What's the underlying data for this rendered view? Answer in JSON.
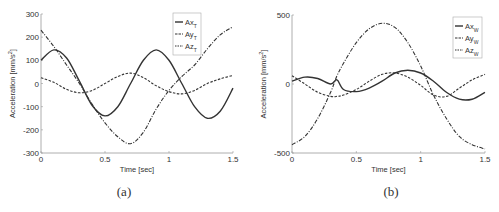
{
  "chart_data": [
    {
      "type": "line",
      "caption": "(a)",
      "xlabel": "Time [sec]",
      "ylabel": "Acceleration [mm/s²]",
      "xlim": [
        0,
        1.5
      ],
      "ylim": [
        -300,
        300
      ],
      "xticks": [
        "0",
        "0.5",
        "1",
        "1.5"
      ],
      "yticks": [
        "300",
        "200",
        "100",
        "0",
        "-100",
        "-200",
        "-300"
      ],
      "legend": [
        "AxT",
        "AyT",
        "AzT"
      ],
      "x": [
        0,
        0.1,
        0.2,
        0.3,
        0.4,
        0.5,
        0.6,
        0.7,
        0.8,
        0.9,
        1.0,
        1.1,
        1.2,
        1.3,
        1.4,
        1.5
      ],
      "series": [
        {
          "name": "AxT",
          "style": "solid",
          "values": [
            100,
            145,
            110,
            10,
            -95,
            -140,
            -100,
            0,
            100,
            145,
            100,
            0,
            -100,
            -150,
            -120,
            -20
          ]
        },
        {
          "name": "AyT",
          "style": "dash-dot",
          "values": [
            230,
            160,
            80,
            0,
            -90,
            -170,
            -230,
            -260,
            -210,
            -110,
            -30,
            30,
            80,
            150,
            210,
            245
          ]
        },
        {
          "name": "AzT",
          "style": "dashed",
          "values": [
            25,
            5,
            -25,
            -40,
            -30,
            0,
            30,
            45,
            25,
            -10,
            -35,
            -45,
            -30,
            0,
            20,
            35
          ]
        }
      ]
    },
    {
      "type": "line",
      "caption": "(b)",
      "xlabel": "Time [sec]",
      "ylabel": "Acceleration [mm/s²]",
      "xlim": [
        0,
        1.5
      ],
      "ylim": [
        -500,
        500
      ],
      "xticks": [
        "0",
        "0.5",
        "1",
        "1.5"
      ],
      "yticks": [
        "500",
        "0",
        "-500"
      ],
      "legend": [
        "AxW",
        "AyW",
        "AzW"
      ],
      "x": [
        0,
        0.1,
        0.2,
        0.3,
        0.35,
        0.4,
        0.5,
        0.6,
        0.7,
        0.8,
        0.9,
        1.0,
        1.1,
        1.2,
        1.3,
        1.4,
        1.5
      ],
      "series": [
        {
          "name": "AxW",
          "style": "solid",
          "values": [
            20,
            50,
            40,
            0,
            30,
            -40,
            -55,
            -30,
            20,
            80,
            100,
            80,
            20,
            -60,
            -110,
            -110,
            -60
          ]
        },
        {
          "name": "AyW",
          "style": "dash-dot",
          "values": [
            -440,
            -380,
            -250,
            -60,
            60,
            150,
            300,
            400,
            440,
            410,
            300,
            130,
            -80,
            -250,
            -380,
            -440,
            -470
          ]
        },
        {
          "name": "AzW",
          "style": "dashed",
          "values": [
            60,
            0,
            -60,
            -90,
            -90,
            -80,
            -40,
            20,
            70,
            80,
            50,
            -10,
            -80,
            -90,
            -30,
            30,
            70
          ]
        }
      ]
    }
  ],
  "captions": {
    "a": "(a)",
    "b": "(b)"
  },
  "axis_labels": {
    "x": "Time [sec]",
    "y": "Acceleration [mm/s²]"
  }
}
